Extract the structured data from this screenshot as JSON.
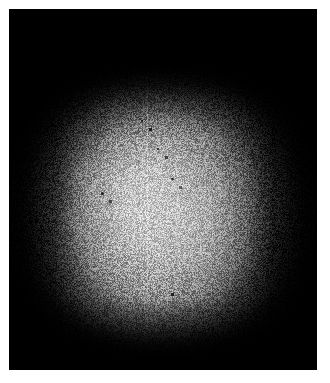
{
  "page": {
    "background_color": "#ffffff",
    "width": 330,
    "height": 383
  },
  "capture": {
    "name": "beam-profile-capture",
    "background_color": "#000000",
    "frame": {
      "left": 9,
      "top": 9,
      "width": 308,
      "height": 361
    },
    "description": "Grayscale sensor capture of a diffuse luminous square beam spot on a black field with heavy pixel grain.",
    "colors": {
      "background": "#000000",
      "halo": "#4e4e4e",
      "mid": "#969696",
      "core": "#c4c4c4",
      "hotspot": "#d6d6d6",
      "margin": "#ffffff"
    }
  },
  "chart_data": {
    "type": "heatmap",
    "title": "",
    "subtitle": "",
    "xlabel": "",
    "ylabel": "",
    "colormap": "grayscale",
    "grid": false,
    "legend": "none",
    "xlim": [
      0,
      308
    ],
    "ylim": [
      0,
      361
    ],
    "intensity_range": [
      0,
      255
    ],
    "peak": {
      "x": 136,
      "y": 196,
      "intensity": 178
    },
    "centroid": {
      "x": 152,
      "y": 200
    },
    "spot_extent": {
      "x_min": 32,
      "x_max": 282,
      "y_min": 82,
      "y_max": 322
    },
    "x": [
      14,
      45,
      76,
      107,
      138,
      169,
      200,
      231,
      262,
      293
    ],
    "y": [
      18,
      56,
      94,
      132,
      170,
      208,
      246,
      284,
      322,
      350
    ],
    "values": [
      [
        2,
        3,
        4,
        5,
        6,
        5,
        4,
        3,
        2,
        2
      ],
      [
        3,
        5,
        8,
        12,
        14,
        12,
        9,
        6,
        3,
        2
      ],
      [
        5,
        14,
        38,
        66,
        82,
        74,
        56,
        30,
        11,
        4
      ],
      [
        8,
        34,
        92,
        134,
        152,
        144,
        122,
        72,
        24,
        7
      ],
      [
        10,
        48,
        124,
        162,
        170,
        160,
        142,
        96,
        33,
        9
      ],
      [
        11,
        52,
        132,
        168,
        178,
        166,
        150,
        104,
        36,
        10
      ],
      [
        10,
        46,
        120,
        158,
        168,
        158,
        140,
        94,
        31,
        9
      ],
      [
        7,
        30,
        86,
        128,
        146,
        138,
        116,
        66,
        21,
        6
      ],
      [
        4,
        12,
        34,
        60,
        76,
        68,
        50,
        26,
        9,
        3
      ],
      [
        2,
        4,
        7,
        11,
        14,
        12,
        9,
        5,
        3,
        2
      ]
    ],
    "artifacts": [
      {
        "name": "vertical-scan-line",
        "type": "line",
        "orientation": "vertical",
        "x": 138,
        "y_start": 72,
        "y_end": 318,
        "relative_intensity": 12
      },
      {
        "name": "dust-speck",
        "type": "point",
        "x": 101,
        "y": 192,
        "intensity": 18
      },
      {
        "name": "dust-speck",
        "type": "point",
        "x": 157,
        "y": 148,
        "intensity": 20
      },
      {
        "name": "dust-speck",
        "type": "point",
        "x": 171,
        "y": 178,
        "intensity": 22
      },
      {
        "name": "dust-speck",
        "type": "point",
        "x": 163,
        "y": 285,
        "intensity": 26
      },
      {
        "name": "dust-speck",
        "type": "point",
        "x": 207,
        "y": 338,
        "intensity": 16
      },
      {
        "name": "dust-speck",
        "type": "point",
        "x": 141,
        "y": 120,
        "intensity": 19
      }
    ]
  }
}
